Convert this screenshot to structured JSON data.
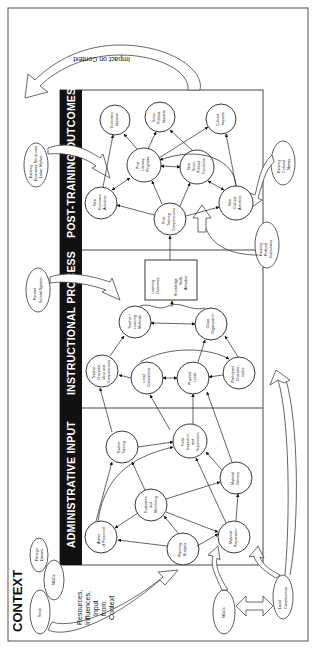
{
  "diagram": {
    "title": "CONTEXT",
    "orientation": "rotated 90deg counter-clockwise (read bottom to top)",
    "sections": [
      {
        "id": "admin",
        "label": "ADMINISTRATIVE INPUT"
      },
      {
        "id": "instr",
        "label": "INSTRUCTIONAL PROCESS"
      },
      {
        "id": "post",
        "label": "POST-TRAINING OUTCOMES"
      }
    ],
    "context_nodes": {
      "state": "State",
      "ngos_top": "NGOs",
      "foreign_donors": [
        "Foreign",
        "Donors"
      ],
      "ngos_bottom": "NGOs",
      "local_communities": [
        "Local",
        "Communities"
      ],
      "formal_school_system": [
        "Formal",
        "School System"
      ],
      "existing_economic": [
        "Existing",
        "Economic Structures",
        "Labor Market"
      ],
      "existing_political": [
        "Existing",
        "Political",
        "Institutions"
      ],
      "existing_cultural": [
        "Existing",
        "Cultural",
        "Norms"
      ]
    },
    "resources_label": [
      "Resources,",
      "Influences,",
      "Input",
      "from",
      "Context"
    ],
    "impact_label": "Impact on Context",
    "admin_nodes": {
      "admin_personnel": [
        "Admin.",
        "of Personnel"
      ],
      "evaluation": [
        "Evaluation",
        "and",
        "Monitoring"
      ],
      "planning": [
        "Planning",
        "Budgets"
      ],
      "teacher_training": [
        "Teacher",
        "Training"
      ],
      "field_inspection": [
        "Field",
        "Inspection",
        "and",
        "Supervision"
      ],
      "material_delivery": [
        "Material",
        "Delivery"
      ],
      "material_preparation": [
        "Material",
        "Preparation"
      ]
    },
    "instr_nodes": {
      "teacher_char": [
        "Teacher",
        "Character-",
        "istics and",
        "Competencies"
      ],
      "local_committees": [
        "Local",
        "Committees"
      ],
      "physical_local": [
        "Physical",
        "Local"
      ],
      "participant_char": [
        "Participant",
        "Characte-",
        "ristics"
      ],
      "teacher_learning": [
        "Teacher /",
        "Learning",
        "Methods"
      ],
      "class_org": [
        "Class",
        "Organization"
      ],
      "learning_outcomes": [
        "Learning",
        "Outcomes:",
        "",
        "Knowledge",
        "Skills",
        "Attitudes"
      ]
    },
    "post_nodes": {
      "post_training": [
        "Post-",
        "Training",
        "Competencies"
      ],
      "new_economic": [
        "New",
        "Economic",
        "Activities"
      ],
      "new_cultural": [
        "New",
        "Cultural",
        "Activities"
      ],
      "post_literacy": [
        "Post",
        "Literacy",
        "Programs"
      ],
      "new_sociopolitical": [
        "New",
        "Socio-",
        "Political",
        "Functions"
      ],
      "economic_impacts": [
        "Economic",
        "Impacts"
      ],
      "sociopolitical_impacts": [
        "Socio-",
        "Political",
        "Impacts"
      ],
      "cultural_impacts": [
        "Cultural",
        "Impacts"
      ]
    }
  }
}
